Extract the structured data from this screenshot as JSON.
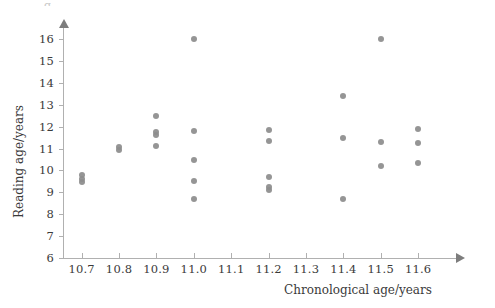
{
  "chart_data": {
    "type": "scatter",
    "title": "",
    "xlabel": "Chronological age/years",
    "ylabel": "Reading age/years",
    "xlim": [
      10.65,
      11.68
    ],
    "ylim": [
      6,
      16.6
    ],
    "grid": false,
    "legend": null,
    "xticks": [
      "10.7",
      "10.8",
      "10.9",
      "11.0",
      "11.1",
      "11.2",
      "11.3",
      "11.4",
      "11.5",
      "11.6"
    ],
    "xtick_values": [
      10.7,
      10.8,
      10.9,
      11.0,
      11.1,
      11.2,
      11.3,
      11.4,
      11.5,
      11.6
    ],
    "yticks": [
      "6",
      "7",
      "8",
      "9",
      "10",
      "11",
      "12",
      "13",
      "14",
      "15",
      "16"
    ],
    "ytick_values": [
      6,
      7,
      8,
      9,
      10,
      11,
      12,
      13,
      14,
      15,
      16
    ],
    "marker_color": "#8c8c8c",
    "axis_color": "#b0b0b0",
    "points": [
      {
        "x": 10.7,
        "y": 9.8
      },
      {
        "x": 10.7,
        "y": 9.6
      },
      {
        "x": 10.7,
        "y": 9.45
      },
      {
        "x": 10.8,
        "y": 11.05
      },
      {
        "x": 10.8,
        "y": 10.95
      },
      {
        "x": 10.9,
        "y": 12.5
      },
      {
        "x": 10.9,
        "y": 11.75
      },
      {
        "x": 10.9,
        "y": 11.6
      },
      {
        "x": 10.9,
        "y": 11.1
      },
      {
        "x": 11.0,
        "y": 16.0
      },
      {
        "x": 11.0,
        "y": 11.8
      },
      {
        "x": 11.0,
        "y": 10.5
      },
      {
        "x": 11.0,
        "y": 9.5
      },
      {
        "x": 11.0,
        "y": 8.7
      },
      {
        "x": 11.2,
        "y": 11.85
      },
      {
        "x": 11.2,
        "y": 11.35
      },
      {
        "x": 11.2,
        "y": 9.7
      },
      {
        "x": 11.2,
        "y": 9.25
      },
      {
        "x": 11.2,
        "y": 9.1
      },
      {
        "x": 11.4,
        "y": 13.4
      },
      {
        "x": 11.4,
        "y": 11.5
      },
      {
        "x": 11.4,
        "y": 8.7
      },
      {
        "x": 11.5,
        "y": 16.0
      },
      {
        "x": 11.5,
        "y": 11.3
      },
      {
        "x": 11.5,
        "y": 10.2
      },
      {
        "x": 11.6,
        "y": 11.9
      },
      {
        "x": 11.6,
        "y": 11.25
      },
      {
        "x": 11.6,
        "y": 10.35
      }
    ]
  },
  "artifact": {
    "text": "g"
  }
}
